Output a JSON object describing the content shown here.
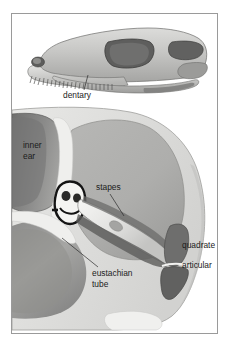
{
  "figure": {
    "frame": {
      "border_color": "#9a9a9a",
      "background": "#ffffff"
    }
  },
  "palette": {
    "ink": "#1b1b1b",
    "leader_line": "#2b2b2b",
    "frame_border": "#9a9a9a",
    "bone_light": "#e9e9e7",
    "bone_mid": "#c9c9c7",
    "bone_shadow": "#a9a9a7",
    "cavity_gray": "#b0b0ae",
    "cavity_dark": "#7e7e7d",
    "dark_gray": "#6a6a69",
    "darkest": "#4a4a49",
    "highlight": "#f4f4f2",
    "outline": "#5b5b5a"
  },
  "upper_panel": {
    "name": "skull-lateral-view",
    "description": "Lateral view of a reptilian skull facing left with teeth, nostril, orbit and temporal fenestra",
    "labels": [
      {
        "id": "dentary",
        "text": "dentary",
        "x": 62,
        "y": 80
      }
    ]
  },
  "lower_panel": {
    "name": "middle-ear-cross-section",
    "description": "Cross-section through the middle ear showing stapes spanning from inner ear to quadrate",
    "labels": [
      {
        "id": "inner-ear",
        "lines": [
          "inner",
          "ear"
        ],
        "x": 22,
        "y": 131
      },
      {
        "id": "stapes",
        "text": "stapes",
        "x": 95,
        "y": 178
      },
      {
        "id": "eustachian-tube",
        "lines": [
          "eustachian",
          "tube"
        ],
        "x": 93,
        "y": 272
      },
      {
        "id": "quadrate",
        "text": "quadrate",
        "x": 183,
        "y": 243
      },
      {
        "id": "articular",
        "text": "articular",
        "x": 183,
        "y": 262
      }
    ]
  },
  "label_texts": {
    "dentary": "dentary",
    "inner": "inner",
    "ear": "ear",
    "stapes": "stapes",
    "eustachian": "eustachian",
    "tube": "tube",
    "quadrate": "quadrate",
    "articular": "articular"
  }
}
